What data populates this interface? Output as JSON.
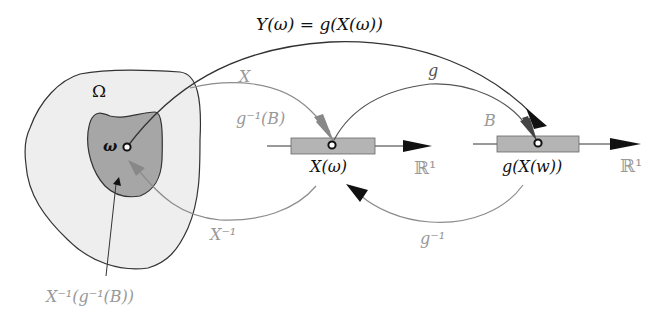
{
  "colors": {
    "omega_fill": "#eeeeee",
    "inner_fill": "#a6a6a6",
    "interval_fill": "#b4b4b4",
    "dark_stroke": "#333333",
    "gray_stroke": "#8c8c8c",
    "gray_text": "#999999",
    "black": "#111111"
  },
  "labels": {
    "top_formula": "Y(ω) = g(X(ω))",
    "omega_set": "Ω",
    "omega_point": "ω",
    "map_X": "X",
    "preimage_g_B": "g⁻¹(B)",
    "map_g": "g",
    "set_B": "B",
    "point_X_omega": "X(ω)",
    "point_gX": "g(X(w))",
    "real_line_1": "ℝ¹",
    "real_line_2": "ℝ¹",
    "map_X_inv": "X⁻¹",
    "map_g_inv": "g⁻¹",
    "preimage_full": "X⁻¹(g⁻¹(B))"
  }
}
